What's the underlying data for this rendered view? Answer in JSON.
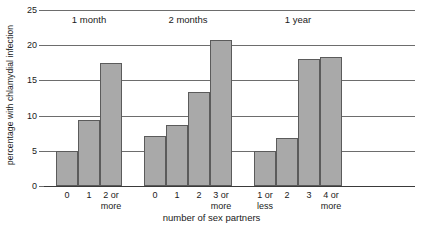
{
  "chart_data": {
    "type": "bar",
    "title": "",
    "xlabel": "number of sex partners",
    "ylabel": "percentage with chlamydial infection",
    "ylim": [
      0,
      25
    ],
    "yticks": [
      0,
      5,
      10,
      15,
      20,
      25
    ],
    "ytick_labels": [
      "0",
      "5",
      "10",
      "15",
      "20",
      "25"
    ],
    "grid": true,
    "legend": false,
    "groups": [
      {
        "name": "1 month",
        "categories": [
          "0",
          "1",
          "2 or more"
        ],
        "values": [
          5.0,
          9.4,
          17.5
        ]
      },
      {
        "name": "2 months",
        "categories": [
          "0",
          "1",
          "2",
          "3 or more"
        ],
        "values": [
          7.1,
          8.6,
          13.4,
          20.8
        ]
      },
      {
        "name": "1 year",
        "categories": [
          "1 or less",
          "2",
          "3",
          "4 or more"
        ],
        "values": [
          5.0,
          6.8,
          18.0,
          18.3
        ]
      }
    ],
    "bar_color": "#a9a9a9",
    "bar_edge_color": "#5b5b5b",
    "axis_color": "#6d6d6d"
  },
  "axes": {
    "y_title": "percentage with chlamydial infection",
    "x_title": "number of sex partners"
  },
  "categories_flat": [
    {
      "label_line1": "0",
      "label_line2": ""
    },
    {
      "label_line1": "1",
      "label_line2": ""
    },
    {
      "label_line1": "2 or",
      "label_line2": "more"
    },
    {
      "label_line1": "0",
      "label_line2": ""
    },
    {
      "label_line1": "1",
      "label_line2": ""
    },
    {
      "label_line1": "2",
      "label_line2": ""
    },
    {
      "label_line1": "3 or",
      "label_line2": "more"
    },
    {
      "label_line1": "1 or",
      "label_line2": "less"
    },
    {
      "label_line1": "2",
      "label_line2": ""
    },
    {
      "label_line1": "3",
      "label_line2": ""
    },
    {
      "label_line1": "4 or",
      "label_line2": "more"
    }
  ],
  "group_headings": [
    "1 month",
    "2 months",
    "1 year"
  ]
}
